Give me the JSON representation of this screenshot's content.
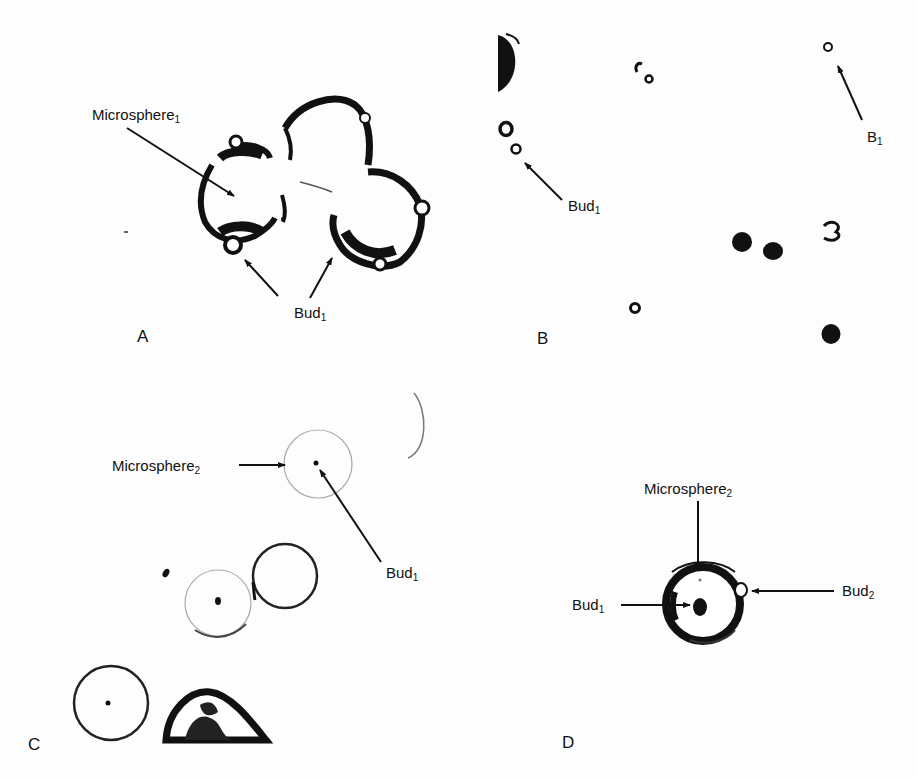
{
  "figure": {
    "panels": [
      {
        "id": "A",
        "letter": "A",
        "labels": [
          {
            "text": "Microsphere",
            "subscript": "1"
          },
          {
            "text": "Bud",
            "subscript": "1"
          }
        ]
      },
      {
        "id": "B",
        "letter": "B",
        "labels": [
          {
            "text": "Bud",
            "subscript": "1"
          },
          {
            "text": "B",
            "subscript": "1"
          }
        ]
      },
      {
        "id": "C",
        "letter": "C",
        "labels": [
          {
            "text": "Microsphere",
            "subscript": "2"
          },
          {
            "text": "Bud",
            "subscript": "1"
          }
        ]
      },
      {
        "id": "D",
        "letter": "D",
        "labels": [
          {
            "text": "Microsphere",
            "subscript": "2"
          },
          {
            "text": "Bud",
            "subscript": "1"
          },
          {
            "text": "Bud",
            "subscript": "2"
          }
        ]
      }
    ]
  }
}
